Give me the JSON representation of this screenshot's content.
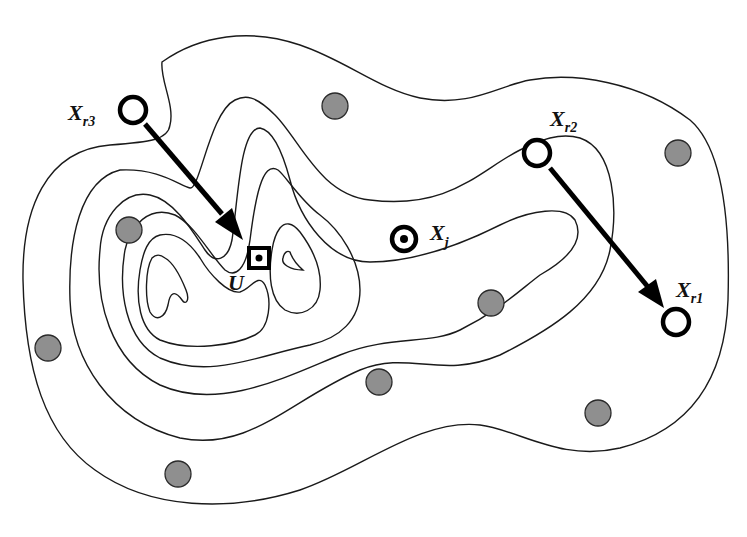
{
  "diagram": {
    "type": "contour-map",
    "labels": {
      "xr3": {
        "main": "X",
        "sub": "r3"
      },
      "xr2": {
        "main": "X",
        "sub": "r2"
      },
      "xr1": {
        "main": "X",
        "sub": "r1"
      },
      "xj": {
        "main": "X",
        "sub": "j"
      },
      "u": {
        "main": "U"
      }
    },
    "arrows": [
      {
        "from": "X_r3",
        "to": "U"
      },
      {
        "from": "X_r2",
        "to": "X_r1"
      }
    ],
    "sample_points_count": 10,
    "colors": {
      "line": "#1a1a1a",
      "sample_fill": "#8f8f8f",
      "marker": "#000000",
      "background": "#ffffff"
    }
  }
}
